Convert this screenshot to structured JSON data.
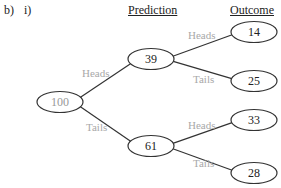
{
  "question": {
    "part": "b)",
    "subpart": "i)"
  },
  "headers": {
    "prediction": "Prediction",
    "outcome": "Outcome"
  },
  "colors": {
    "line": "#333333",
    "label": "#a8a8a8",
    "root_text": "#999999",
    "text": "#222222"
  },
  "tree": {
    "root": {
      "value": "100",
      "cx": 60,
      "cy": 102
    },
    "predictions": [
      {
        "value": "39",
        "cx": 151,
        "cy": 59,
        "edge_label": "Heads",
        "lx": 82,
        "ly": 77
      },
      {
        "value": "61",
        "cx": 151,
        "cy": 146,
        "edge_label": "Tails",
        "lx": 86,
        "ly": 131
      }
    ],
    "outcomes": [
      {
        "value": "14",
        "cx": 254,
        "cy": 32,
        "parent": 0,
        "edge_label": "Heads",
        "lx": 188,
        "ly": 39
      },
      {
        "value": "25",
        "cx": 254,
        "cy": 81,
        "parent": 0,
        "edge_label": "Tails",
        "lx": 193,
        "ly": 83
      },
      {
        "value": "33",
        "cx": 254,
        "cy": 120,
        "parent": 1,
        "edge_label": "Heads",
        "lx": 188,
        "ly": 129
      },
      {
        "value": "28",
        "cx": 254,
        "cy": 173,
        "parent": 1,
        "edge_label": "Tails",
        "lx": 193,
        "ly": 167
      }
    ]
  }
}
